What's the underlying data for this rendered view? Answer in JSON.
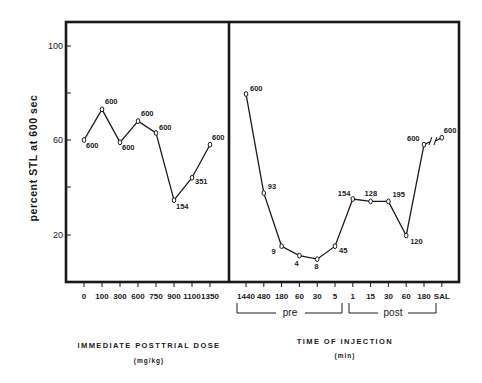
{
  "chart_data": [
    {
      "type": "line",
      "panel": "left",
      "title": "",
      "xlabel": "IMMEDIATE POSTTRIAL DOSE",
      "xlabel_units": "(mg/kg)",
      "ylabel": "percent STL at 600 sec",
      "ylim": [
        10,
        110
      ],
      "yticks": [
        20,
        40,
        60,
        80,
        100
      ],
      "ytick_labels": [
        "20",
        "",
        "60",
        "",
        "100"
      ],
      "grid": false,
      "categories": [
        "0",
        "100",
        "300",
        "600",
        "750",
        "900",
        "1100",
        "1350"
      ],
      "values": [
        60,
        73,
        59,
        68,
        63,
        34.5,
        44,
        58
      ],
      "point_labels": [
        "600",
        "600",
        "600",
        "600",
        "600",
        "154",
        "351",
        "600"
      ]
    },
    {
      "type": "line",
      "panel": "right",
      "title": "",
      "xlabel": "TIME OF INJECTION",
      "xlabel_units": "(min)",
      "ylabel": "percent STL at 600 sec",
      "ylim": [
        10,
        110
      ],
      "grid": false,
      "categories": [
        "1440",
        "480",
        "180",
        "60",
        "30",
        "5",
        "1",
        "15",
        "30",
        "60",
        "180",
        "SAL"
      ],
      "groups": [
        {
          "label": "pre",
          "categories": [
            "1440",
            "480",
            "180",
            "60",
            "30",
            "5"
          ]
        },
        {
          "label": "post",
          "categories": [
            "1",
            "15",
            "30",
            "60",
            "180"
          ]
        }
      ],
      "values": [
        79.5,
        37.5,
        15,
        11,
        9.5,
        15,
        35,
        34,
        34,
        19.5,
        58,
        61
      ],
      "point_labels": [
        "600",
        "93",
        "9",
        "4",
        "8",
        "45",
        "154",
        "128",
        "195",
        "120",
        "600",
        "600"
      ],
      "annotations": [
        "axis break between 180 and SAL"
      ]
    }
  ],
  "labels": {
    "y_axis": "percent STL at 600 sec",
    "left_x_title": "IMMEDIATE POSTTRIAL DOSE",
    "left_x_units": "(mg/kg)",
    "right_x_title": "TIME OF INJECTION",
    "right_x_units": "(min)",
    "pre": "pre",
    "post": "post",
    "yticks": {
      "t100": "100",
      "t60": "60",
      "t20": "20"
    }
  }
}
